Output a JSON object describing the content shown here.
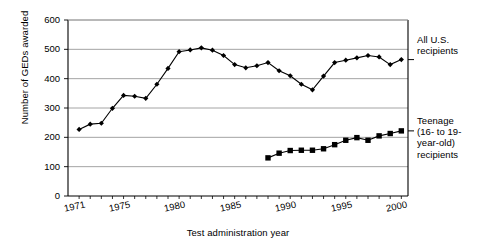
{
  "chart_data": {
    "type": "line",
    "title": "",
    "xlabel": "Test administration year",
    "ylabel": "Number of GEDs awarded",
    "xlim": [
      1970,
      2000.6
    ],
    "ylim": [
      0,
      600
    ],
    "grid": true,
    "legend_position": "right",
    "ytick_labels": [
      "0",
      "100",
      "200",
      "300",
      "400",
      "500",
      "600"
    ],
    "ytick_values": [
      0,
      100,
      200,
      300,
      400,
      500,
      600
    ],
    "xtick_labels": [
      "1971",
      "1975",
      "1980",
      "1985",
      "1990",
      "1995",
      "2000"
    ],
    "xtick_values": [
      1971,
      1975,
      1980,
      1985,
      1990,
      1995,
      2000
    ],
    "series": [
      {
        "name": "All U.S. recipients",
        "marker": "diamond",
        "x": [
          1971,
          1972,
          1973,
          1974,
          1975,
          1976,
          1977,
          1978,
          1979,
          1980,
          1981,
          1982,
          1983,
          1984,
          1985,
          1986,
          1987,
          1988,
          1989,
          1990,
          1991,
          1992,
          1993,
          1994,
          1995,
          1996,
          1997,
          1998,
          1999,
          2000
        ],
        "values": [
          227,
          245,
          248,
          299,
          343,
          340,
          333,
          381,
          435,
          492,
          498,
          505,
          497,
          479,
          448,
          437,
          444,
          455,
          427,
          410,
          381,
          362,
          409,
          455,
          463,
          471,
          479,
          474,
          448,
          465
        ]
      },
      {
        "name": "Teenage (16- to 19-year-old) recipients",
        "marker": "square",
        "x": [
          1988,
          1989,
          1990,
          1991,
          1992,
          1993,
          1994,
          1995,
          1996,
          1997,
          1998,
          1999,
          2000
        ],
        "values": [
          130,
          146,
          155,
          156,
          156,
          161,
          175,
          190,
          199,
          190,
          205,
          213,
          222
        ]
      }
    ]
  },
  "axes": {
    "y_title": "Number of GEDs awarded",
    "x_title": "Test administration year"
  },
  "legend": {
    "all_us": "All U.S.\nrecipients",
    "teenage": "Teenage\n(16- to 19-\nyear-old)\nrecipients"
  }
}
